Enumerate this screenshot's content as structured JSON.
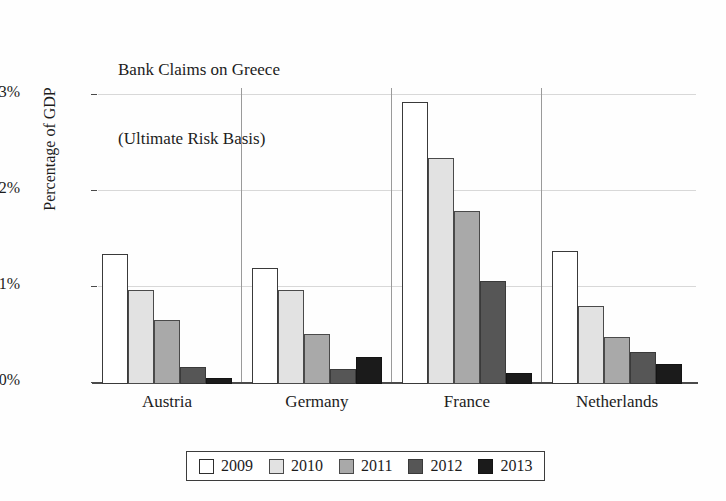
{
  "chart_data": {
    "type": "bar",
    "title": "Bank Claims on Greece",
    "subtitle": "(Ultimate Risk Basis)",
    "xlabel": "",
    "ylabel": "Percentage of GDP",
    "ylim": [
      0,
      3
    ],
    "grid": true,
    "legend_position": "bottom",
    "ytick_labels": [
      "3%",
      "2%",
      "1%",
      "0%"
    ],
    "ytick_values": [
      3,
      2,
      1,
      0
    ],
    "categories": [
      "Austria",
      "Germany",
      "France",
      "Netherlands"
    ],
    "series": [
      {
        "name": "2009",
        "color": "#ffffff",
        "values": [
          1.35,
          1.21,
          2.94,
          1.39
        ]
      },
      {
        "name": "2010",
        "color": "#e2e2e2",
        "values": [
          0.98,
          0.98,
          2.35,
          0.81
        ]
      },
      {
        "name": "2011",
        "color": "#a9a9a9",
        "values": [
          0.67,
          0.52,
          1.8,
          0.49
        ]
      },
      {
        "name": "2012",
        "color": "#565656",
        "values": [
          0.18,
          0.16,
          1.07,
          0.33
        ]
      },
      {
        "name": "2013",
        "color": "#1b1b1b",
        "values": [
          0.06,
          0.28,
          0.11,
          0.21
        ]
      }
    ]
  }
}
